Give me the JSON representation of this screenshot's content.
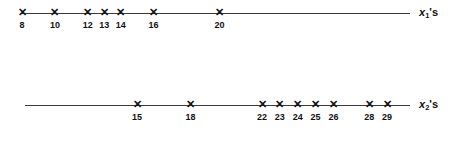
{
  "figure": {
    "type": "dotplot-numberlines",
    "background_color": "#ffffff",
    "line_color": "#3a3a3a",
    "text_color": "#111111",
    "marker_glyph": "✕"
  },
  "lines": [
    {
      "id": "x1-number-line",
      "axis_label_var": "x",
      "axis_label_sub": "1",
      "axis_label_poss": "'s",
      "axis_label_text": "x1's",
      "line_top": 13,
      "line_start_px": 22,
      "line_end_px": 410,
      "origin_value": 8,
      "origin_px": 22,
      "px_per_unit": 16.45,
      "label_px": 419,
      "values": [
        8,
        10,
        12,
        13,
        14,
        16,
        20
      ],
      "tick_labels": [
        "8",
        "10",
        "12",
        "13",
        "14",
        "16",
        "20"
      ]
    },
    {
      "id": "x2-number-line",
      "axis_label_var": "x",
      "axis_label_sub": "2",
      "axis_label_poss": "'s",
      "axis_label_text": "x2's",
      "line_top": 105,
      "line_start_px": 25,
      "line_end_px": 410,
      "origin_value": 15,
      "origin_px": 137,
      "px_per_unit": 17.86,
      "label_px": 419,
      "values": [
        15,
        18,
        22,
        23,
        24,
        25,
        26,
        28,
        29
      ],
      "tick_labels": [
        "15",
        "18",
        "22",
        "23",
        "24",
        "25",
        "26",
        "28",
        "29"
      ]
    }
  ],
  "chart_data": {
    "type": "scatter",
    "title": "",
    "subtitle": "",
    "xlabel": "",
    "ylabel": "",
    "grid": false,
    "legend": "none",
    "annotations": [
      "x1's",
      "x2's"
    ],
    "series": [
      {
        "name": "x1's",
        "values": [
          8,
          10,
          12,
          13,
          14,
          16,
          20
        ],
        "count": 7,
        "axis_range": [
          8,
          20
        ]
      },
      {
        "name": "x2's",
        "values": [
          15,
          18,
          22,
          23,
          24,
          25,
          26,
          28,
          29
        ],
        "count": 9,
        "axis_range": [
          15,
          29
        ]
      }
    ]
  }
}
